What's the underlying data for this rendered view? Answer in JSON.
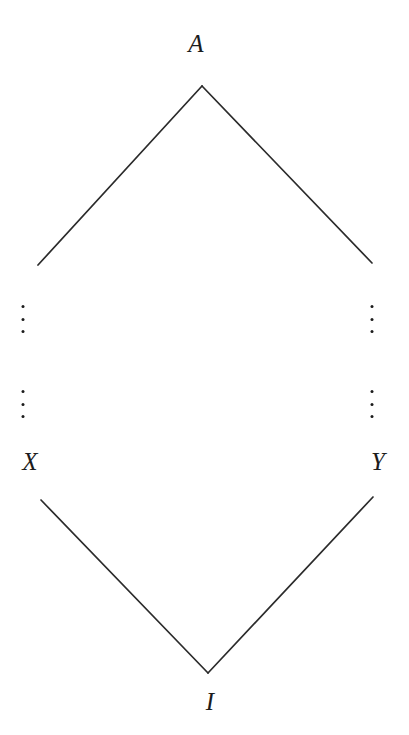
{
  "figure": {
    "kind": "hasse-lattice-diagram",
    "width": 409,
    "height": 735,
    "background_color": "#ffffff",
    "line_color": "#2b2b2b",
    "text_color": "#1c1c1c",
    "line_width": 1.7
  },
  "nodes": [
    {
      "id": "A",
      "label": "A",
      "label_x": 196,
      "label_y": 43,
      "vertex_x": 202,
      "vertex_y": 86,
      "role": "top"
    },
    {
      "id": "X",
      "label": "X",
      "label_x": 30,
      "label_y": 461,
      "vertex_x": 38,
      "vertex_y": 265,
      "role": "left"
    },
    {
      "id": "Y",
      "label": "Y",
      "label_x": 378,
      "label_y": 461,
      "vertex_x": 372,
      "vertex_y": 263,
      "role": "right"
    },
    {
      "id": "I",
      "label": "I",
      "label_x": 210,
      "label_y": 701,
      "vertex_x": 208,
      "vertex_y": 673,
      "role": "bottom"
    }
  ],
  "edges": [
    {
      "id": "A-X",
      "from": "A",
      "to": "X",
      "x1": 202,
      "y1": 86,
      "x2": 38,
      "y2": 265
    },
    {
      "id": "A-Y",
      "from": "A",
      "to": "Y",
      "x1": 202,
      "y1": 86,
      "x2": 372,
      "y2": 263
    },
    {
      "id": "X-I",
      "from": "X",
      "to": "I",
      "x1": 41,
      "y1": 500,
      "x2": 208,
      "y2": 673
    },
    {
      "id": "Y-I",
      "from": "Y",
      "to": "I",
      "x1": 373,
      "y1": 497,
      "x2": 208,
      "y2": 673
    }
  ],
  "ellipses": [
    {
      "id": "left-upper",
      "side": "left",
      "x": 23,
      "y": 319,
      "glyph": "vertical-ellipsis"
    },
    {
      "id": "left-lower",
      "side": "left",
      "x": 23,
      "y": 404,
      "glyph": "vertical-ellipsis"
    },
    {
      "id": "right-upper",
      "side": "right",
      "x": 372,
      "y": 319,
      "glyph": "vertical-ellipsis"
    },
    {
      "id": "right-lower",
      "side": "right",
      "x": 372,
      "y": 404,
      "glyph": "vertical-ellipsis"
    }
  ]
}
